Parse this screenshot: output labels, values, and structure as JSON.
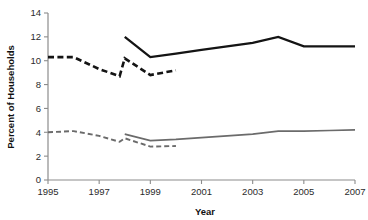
{
  "chart_data": {
    "type": "line",
    "title": "",
    "xlabel": "Year",
    "ylabel": "Percent of Households",
    "xlim": [
      1995,
      2007
    ],
    "ylim": [
      0,
      14
    ],
    "grid": false,
    "legend": "none",
    "x_ticks": [
      "1995",
      "1997",
      "1999",
      "2001",
      "2003",
      "2005",
      "2007"
    ],
    "x_tick_values": [
      1995,
      1997,
      1999,
      2001,
      2003,
      2005,
      2007
    ],
    "y_ticks": [
      "0",
      "2",
      "4",
      "6",
      "8",
      "10",
      "12",
      "14"
    ],
    "y_tick_values": [
      0,
      2,
      4,
      6,
      8,
      10,
      12,
      14
    ],
    "series": [
      {
        "name": "upper-series-old-method",
        "style": "dashed",
        "color": "#141414",
        "x": [
          1995,
          1996,
          1997,
          1997.8,
          1998,
          1999,
          2000
        ],
        "values": [
          10.3,
          10.3,
          9.3,
          8.7,
          10.2,
          8.8,
          9.2
        ]
      },
      {
        "name": "upper-series-new-method",
        "style": "solid",
        "color": "#141414",
        "x": [
          1998,
          1999,
          2000,
          2001,
          2002,
          2003,
          2004,
          2005,
          2006,
          2007
        ],
        "values": [
          12.0,
          10.3,
          10.6,
          10.9,
          11.2,
          11.5,
          12.0,
          11.2,
          11.2,
          11.2
        ]
      },
      {
        "name": "lower-series-old-method",
        "style": "dashed",
        "color": "#6b6b6b",
        "x": [
          1995,
          1996,
          1997,
          1997.8,
          1998,
          1999,
          2000
        ],
        "values": [
          4.0,
          4.1,
          3.7,
          3.2,
          3.5,
          2.8,
          2.85
        ]
      },
      {
        "name": "lower-series-new-method",
        "style": "solid",
        "color": "#6b6b6b",
        "x": [
          1998,
          1999,
          2000,
          2001,
          2002,
          2003,
          2004,
          2005,
          2006,
          2007
        ],
        "values": [
          3.85,
          3.3,
          3.4,
          3.55,
          3.7,
          3.85,
          4.1,
          4.1,
          4.15,
          4.2
        ]
      }
    ]
  },
  "axes": {
    "x_title": "Year",
    "y_title": "Percent of Households"
  }
}
